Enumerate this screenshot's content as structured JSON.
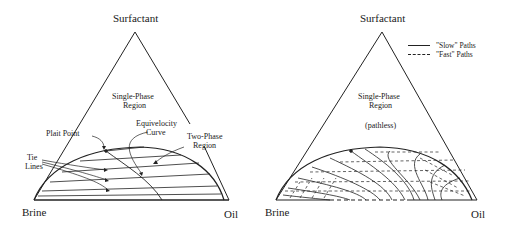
{
  "figure": {
    "panels": [
      {
        "id": "left",
        "apex_label": "Surfactant",
        "left_corner_label": "Brine",
        "right_corner_label": "Oil",
        "region_label_line1": "Single-Phase",
        "region_label_line2": "Region",
        "annotations": {
          "plait_point": "Plait Point",
          "equivelocity_line1": "Equivelocity",
          "equivelocity_line2": "Curve",
          "two_phase_line1": "Two-Phase",
          "two_phase_line2": "Region",
          "tie_lines_line1": "Tie",
          "tie_lines_line2": "Lines"
        }
      },
      {
        "id": "right",
        "apex_label": "Surfactant",
        "left_corner_label": "Brine",
        "right_corner_label": "Oil",
        "region_label_line1": "Single-Phase",
        "region_label_line2": "Region",
        "region_note": "(pathless)",
        "legend": [
          {
            "style": "solid",
            "label": "\"Slow\"  Paths"
          },
          {
            "style": "dashed",
            "label": "\"Fast\"  Paths"
          }
        ]
      }
    ]
  },
  "colors": {
    "line": "#222222",
    "background": "#ffffff"
  }
}
